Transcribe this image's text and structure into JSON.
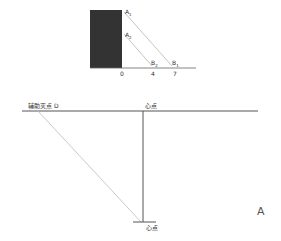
{
  "inset_figure": {
    "block_color": "#333333",
    "points": {
      "A1": {
        "letter": "A",
        "sub": "1"
      },
      "A2": {
        "letter": "A",
        "sub": "2"
      },
      "B1": {
        "letter": "B",
        "sub": "1"
      },
      "B2": {
        "letter": "B",
        "sub": "2"
      }
    },
    "ticks": [
      "0",
      "4",
      "7"
    ]
  },
  "main_figure": {
    "horizon_left_label": "辅助灭点 D",
    "horizon_center_label": "心点",
    "bottom_label": "心点",
    "corner_label": "A"
  },
  "colors": {
    "line": "#555555",
    "light_line": "#aaaaaa",
    "text": "#333333"
  }
}
